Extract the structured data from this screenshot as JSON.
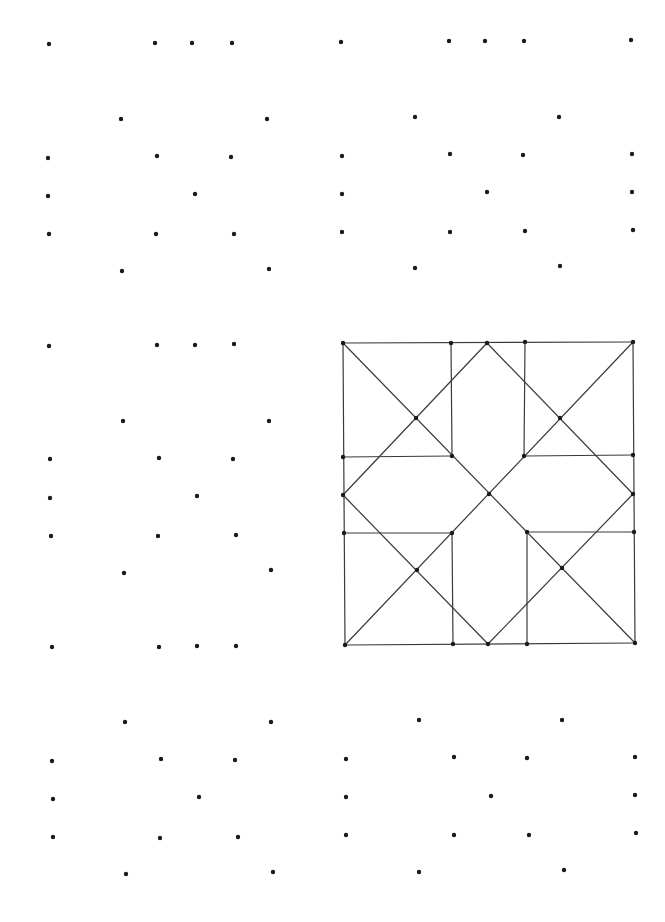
{
  "page": {
    "width": 665,
    "height": 922,
    "background": "#ffffff",
    "dot_color": "#1a1a1a",
    "line_color": "#3a3a3a",
    "dot_radius": 2.2
  },
  "dot_grids": [
    {
      "name": "top-left-grid",
      "points": [
        [
          49,
          44
        ],
        [
          155,
          43
        ],
        [
          192,
          43
        ],
        [
          232,
          43
        ],
        [
          121,
          119
        ],
        [
          267,
          119
        ],
        [
          48,
          158
        ],
        [
          157,
          156
        ],
        [
          231,
          157
        ],
        [
          48,
          196
        ],
        [
          195,
          194
        ],
        [
          49,
          234
        ],
        [
          156,
          234
        ],
        [
          234,
          234
        ],
        [
          122,
          271
        ],
        [
          269,
          269
        ]
      ]
    },
    {
      "name": "top-right-grid",
      "points": [
        [
          341,
          42
        ],
        [
          449,
          41
        ],
        [
          485,
          41
        ],
        [
          524,
          41
        ],
        [
          631,
          40
        ],
        [
          415,
          117
        ],
        [
          559,
          117
        ],
        [
          342,
          156
        ],
        [
          450,
          154
        ],
        [
          523,
          155
        ],
        [
          632,
          154
        ],
        [
          342,
          194
        ],
        [
          487,
          192
        ],
        [
          632,
          192
        ],
        [
          342,
          232
        ],
        [
          450,
          232
        ],
        [
          525,
          231
        ],
        [
          633,
          230
        ],
        [
          415,
          268
        ],
        [
          560,
          266
        ]
      ]
    },
    {
      "name": "middle-left-grid",
      "points": [
        [
          49,
          346
        ],
        [
          157,
          345
        ],
        [
          195,
          345
        ],
        [
          234,
          344
        ],
        [
          123,
          421
        ],
        [
          269,
          421
        ],
        [
          50,
          459
        ],
        [
          159,
          458
        ],
        [
          233,
          459
        ],
        [
          50,
          498
        ],
        [
          197,
          496
        ],
        [
          51,
          536
        ],
        [
          158,
          536
        ],
        [
          236,
          535
        ],
        [
          124,
          573
        ],
        [
          271,
          570
        ],
        [
          52,
          647
        ],
        [
          159,
          647
        ],
        [
          197,
          646
        ],
        [
          236,
          646
        ]
      ]
    },
    {
      "name": "bottom-left-grid",
      "points": [
        [
          125,
          722
        ],
        [
          271,
          722
        ],
        [
          52,
          761
        ],
        [
          161,
          759
        ],
        [
          235,
          760
        ],
        [
          53,
          799
        ],
        [
          199,
          797
        ],
        [
          53,
          837
        ],
        [
          160,
          838
        ],
        [
          238,
          837
        ],
        [
          126,
          874
        ],
        [
          273,
          872
        ]
      ]
    },
    {
      "name": "bottom-right-grid",
      "points": [
        [
          419,
          720
        ],
        [
          562,
          720
        ],
        [
          346,
          759
        ],
        [
          454,
          757
        ],
        [
          527,
          758
        ],
        [
          635,
          757
        ],
        [
          346,
          797
        ],
        [
          491,
          796
        ],
        [
          635,
          795
        ],
        [
          346,
          835
        ],
        [
          454,
          835
        ],
        [
          529,
          835
        ],
        [
          636,
          833
        ],
        [
          419,
          872
        ],
        [
          564,
          870
        ]
      ]
    }
  ],
  "completed_figure": {
    "name": "quilt-star-pattern",
    "points": [
      [
        343,
        343
      ],
      [
        451,
        343
      ],
      [
        487,
        343
      ],
      [
        525,
        342
      ],
      [
        633,
        342
      ],
      [
        416,
        418
      ],
      [
        560,
        418
      ],
      [
        343,
        457
      ],
      [
        452,
        456
      ],
      [
        524,
        456
      ],
      [
        633,
        455
      ],
      [
        343,
        495
      ],
      [
        489,
        494
      ],
      [
        633,
        494
      ],
      [
        344,
        533
      ],
      [
        452,
        533
      ],
      [
        527,
        532
      ],
      [
        634,
        532
      ],
      [
        417,
        570
      ],
      [
        562,
        568
      ],
      [
        345,
        645
      ],
      [
        453,
        644
      ],
      [
        488,
        644
      ],
      [
        527,
        644
      ],
      [
        635,
        643
      ]
    ],
    "segments": [
      [
        [
          343,
          343
        ],
        [
          633,
          342
        ]
      ],
      [
        [
          633,
          342
        ],
        [
          635,
          643
        ]
      ],
      [
        [
          635,
          643
        ],
        [
          345,
          645
        ]
      ],
      [
        [
          345,
          645
        ],
        [
          343,
          343
        ]
      ],
      [
        [
          343,
          457
        ],
        [
          452,
          456
        ]
      ],
      [
        [
          524,
          456
        ],
        [
          633,
          455
        ]
      ],
      [
        [
          344,
          533
        ],
        [
          452,
          533
        ]
      ],
      [
        [
          527,
          532
        ],
        [
          634,
          532
        ]
      ],
      [
        [
          451,
          343
        ],
        [
          452,
          456
        ]
      ],
      [
        [
          525,
          342
        ],
        [
          524,
          456
        ]
      ],
      [
        [
          452,
          533
        ],
        [
          453,
          644
        ]
      ],
      [
        [
          527,
          532
        ],
        [
          527,
          644
        ]
      ],
      [
        [
          343,
          343
        ],
        [
          635,
          643
        ]
      ],
      [
        [
          633,
          342
        ],
        [
          345,
          645
        ]
      ],
      [
        [
          487,
          343
        ],
        [
          343,
          495
        ]
      ],
      [
        [
          343,
          495
        ],
        [
          488,
          644
        ]
      ],
      [
        [
          488,
          644
        ],
        [
          633,
          494
        ]
      ],
      [
        [
          633,
          494
        ],
        [
          487,
          343
        ]
      ]
    ]
  }
}
